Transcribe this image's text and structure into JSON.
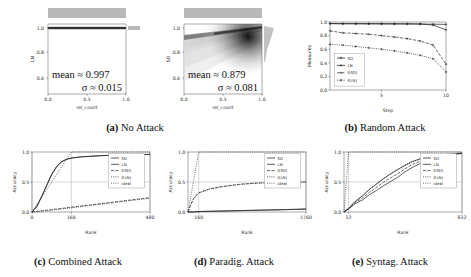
{
  "figure": {
    "caption_a": "No Attack",
    "caption_b": "Random Attack",
    "caption_c": "Combined Attack",
    "caption_d": "Paradig. Attack",
    "caption_e": "Syntag. Attack",
    "label_a": "(a)",
    "label_b": "(b)",
    "label_c": "(c)",
    "label_d": "(d)",
    "label_e": "(e)"
  },
  "chart_data": [
    {
      "id": "a-left",
      "type": "heatmap",
      "title": "No Attack — LN",
      "xlabel": "rel_count",
      "ylabel": "LN",
      "xlim": [
        0.0,
        1.0
      ],
      "ylim": [
        0.5,
        1.03
      ],
      "xticks": [
        "0.0",
        "0.5",
        "1.0"
      ],
      "yticks": [
        "0.6",
        "0.8",
        "1.0"
      ],
      "xtick_values": [
        0.0,
        0.5,
        1.0
      ],
      "ytick_values": [
        0.6,
        0.8,
        1.0
      ],
      "grid": false,
      "annotations": [
        "mean ≈ 0.997",
        "σ ≈ 0.015"
      ],
      "mean": 0.997,
      "sigma": 0.015,
      "density_note": "near-constant dark band at LN = 1.0 across all rel_count; marginal histograms flat/top-heavy",
      "marginal_top": "uniform gray band",
      "marginal_right": "single spike at 1.0"
    },
    {
      "id": "a-right",
      "type": "heatmap",
      "title": "No Attack — SD",
      "xlabel": "rel_count",
      "ylabel": "SD",
      "xlim": [
        0.0,
        1.0
      ],
      "ylim": [
        0.5,
        1.03
      ],
      "xticks": [
        "0.0",
        "0.5",
        "1.0"
      ],
      "yticks": [
        "0.6",
        "0.8",
        "1.0"
      ],
      "xtick_values": [
        0.0,
        0.5,
        1.0
      ],
      "ytick_values": [
        0.6,
        0.8,
        1.0
      ],
      "grid": false,
      "annotations": [
        "mean ≈ 0.879",
        "σ ≈ 0.081"
      ],
      "mean": 0.879,
      "sigma": 0.081,
      "density_note": "diffuse cloud rising from ~0.80 at rel_count 0 to a dark ridge near 0.97 at rel_count 1.0",
      "marginal_top": "uniform gray band",
      "marginal_right": "peak near 0.95 with tail downward"
    },
    {
      "id": "b",
      "type": "line",
      "title": "Random Attack",
      "xlabel": "Step",
      "ylabel": "Measures",
      "xlim": [
        1,
        10
      ],
      "ylim": [
        0.0,
        1.0
      ],
      "xticks": [
        "5",
        "10"
      ],
      "xtick_values": [
        5,
        10
      ],
      "yticks": [
        "0.0",
        "0.2",
        "0.4",
        "0.6",
        "0.8",
        "1.0"
      ],
      "ytick_values": [
        0.0,
        0.2,
        0.4,
        0.6,
        0.8,
        1.0
      ],
      "grid": false,
      "legend_position": "lower left",
      "x": [
        1,
        2,
        3,
        4,
        5,
        6,
        7,
        8,
        9,
        10
      ],
      "series": [
        {
          "name": "SD",
          "values": [
            0.975,
            0.973,
            0.972,
            0.972,
            0.971,
            0.97,
            0.97,
            0.969,
            0.968,
            0.965
          ]
        },
        {
          "name": "LN",
          "values": [
            0.978,
            0.977,
            0.977,
            0.976,
            0.976,
            0.975,
            0.974,
            0.972,
            0.955,
            0.885
          ]
        },
        {
          "name": "f(SD)",
          "values": [
            0.87,
            0.84,
            0.83,
            0.82,
            0.8,
            0.78,
            0.755,
            0.72,
            0.66,
            0.38
          ]
        },
        {
          "name": "f(LN)",
          "values": [
            0.67,
            0.66,
            0.64,
            0.62,
            0.6,
            0.575,
            0.545,
            0.51,
            0.46,
            0.265
          ]
        }
      ]
    },
    {
      "id": "c",
      "type": "line",
      "title": "Combined Attack",
      "xlabel": "Rank",
      "ylabel": "Accuracy",
      "xlim": [
        0,
        480
      ],
      "ylim": [
        0.0,
        1.0
      ],
      "xticks": [
        "0",
        "160",
        "480"
      ],
      "xtick_values": [
        0,
        160,
        480
      ],
      "yticks": [
        "0.0",
        "0.5",
        "1.0"
      ],
      "ytick_values": [
        0.0,
        0.5,
        1.0
      ],
      "grid": true,
      "legend_position": "right",
      "x": [
        0,
        20,
        40,
        60,
        80,
        100,
        120,
        140,
        160,
        200,
        240,
        280,
        320,
        360,
        400,
        440,
        480
      ],
      "series": [
        {
          "name": "SD",
          "values": [
            0.0,
            0.1,
            0.27,
            0.45,
            0.63,
            0.76,
            0.84,
            0.88,
            0.9,
            0.92,
            0.93,
            0.94,
            0.945,
            0.95,
            0.955,
            0.958,
            0.96
          ]
        },
        {
          "name": "LN",
          "values": [
            0.0,
            0.09,
            0.26,
            0.44,
            0.62,
            0.75,
            0.835,
            0.875,
            0.898,
            0.918,
            0.928,
            0.938,
            0.944,
            0.949,
            0.954,
            0.957,
            0.96
          ]
        },
        {
          "name": "f(SD)",
          "values": [
            0.0,
            0.01,
            0.02,
            0.03,
            0.04,
            0.05,
            0.06,
            0.07,
            0.08,
            0.1,
            0.12,
            0.14,
            0.16,
            0.18,
            0.2,
            0.22,
            0.24
          ]
        },
        {
          "name": "f(LN)",
          "values": [
            0.0,
            0.008,
            0.015,
            0.022,
            0.03,
            0.04,
            0.05,
            0.06,
            0.07,
            0.09,
            0.11,
            0.13,
            0.15,
            0.17,
            0.19,
            0.21,
            0.23
          ]
        },
        {
          "name": "ideal",
          "values": [
            0.0,
            0.125,
            0.25,
            0.375,
            0.5,
            0.625,
            0.75,
            0.875,
            1.0,
            1.0,
            1.0,
            1.0,
            1.0,
            1.0,
            1.0,
            1.0,
            1.0
          ]
        }
      ]
    },
    {
      "id": "d",
      "type": "line",
      "title": "Paradig. Attack",
      "xlabel": "Rank",
      "ylabel": "Accuracy",
      "xlim": [
        0,
        1760
      ],
      "ylim": [
        0.0,
        1.0
      ],
      "xticks": [
        "160",
        "1760"
      ],
      "xtick_values": [
        160,
        1760
      ],
      "yticks": [
        "0.0",
        "0.5",
        "1.0"
      ],
      "ytick_values": [
        0.0,
        0.5,
        1.0
      ],
      "grid": true,
      "legend_position": "upper right",
      "x": [
        0,
        40,
        80,
        120,
        160,
        320,
        480,
        640,
        800,
        960,
        1120,
        1280,
        1440,
        1600,
        1760
      ],
      "series": [
        {
          "name": "SD",
          "values": [
            0.0,
            0.0,
            0.0,
            0.005,
            0.008,
            0.012,
            0.016,
            0.02,
            0.024,
            0.028,
            0.032,
            0.036,
            0.04,
            0.045,
            0.05
          ]
        },
        {
          "name": "LN",
          "values": [
            0.0,
            0.0,
            0.0,
            0.004,
            0.007,
            0.011,
            0.015,
            0.019,
            0.023,
            0.027,
            0.031,
            0.035,
            0.039,
            0.043,
            0.048
          ]
        },
        {
          "name": "f(SD)",
          "values": [
            0.0,
            0.12,
            0.22,
            0.28,
            0.32,
            0.385,
            0.42,
            0.445,
            0.465,
            0.478,
            0.487,
            0.493,
            0.497,
            0.499,
            0.5
          ]
        },
        {
          "name": "f(LN)",
          "values": [
            0.0,
            0.11,
            0.21,
            0.27,
            0.315,
            0.38,
            0.415,
            0.44,
            0.462,
            0.475,
            0.485,
            0.491,
            0.496,
            0.498,
            0.5
          ]
        },
        {
          "name": "ideal",
          "values": [
            0.0,
            0.25,
            0.5,
            0.75,
            1.0,
            1.0,
            1.0,
            1.0,
            1.0,
            1.0,
            1.0,
            1.0,
            1.0,
            1.0,
            1.0
          ]
        }
      ]
    },
    {
      "id": "e",
      "type": "line",
      "title": "Syntag. Attack",
      "xlabel": "Rank",
      "ylabel": "Accuracy",
      "xlim": [
        0,
        832
      ],
      "ylim": [
        0.0,
        1.0
      ],
      "xticks": [
        "32",
        "832"
      ],
      "xtick_values": [
        32,
        832
      ],
      "yticks": [
        "0.0",
        "0.5",
        "1.0"
      ],
      "ytick_values": [
        0.0,
        0.5,
        1.0
      ],
      "grid": true,
      "legend_position": "upper right",
      "x": [
        0,
        32,
        80,
        130,
        180,
        230,
        280,
        330,
        380,
        430,
        480,
        530,
        580,
        640,
        700,
        760,
        832
      ],
      "series": [
        {
          "name": "SD",
          "values": [
            0.0,
            0.05,
            0.14,
            0.2,
            0.29,
            0.36,
            0.44,
            0.51,
            0.58,
            0.67,
            0.74,
            0.8,
            0.86,
            0.91,
            0.94,
            0.96,
            0.975
          ]
        },
        {
          "name": "LN",
          "values": [
            0.0,
            0.06,
            0.18,
            0.27,
            0.38,
            0.47,
            0.56,
            0.64,
            0.71,
            0.78,
            0.84,
            0.88,
            0.91,
            0.935,
            0.955,
            0.968,
            0.98
          ]
        },
        {
          "name": "f(SD)",
          "values": [
            0.0,
            0.055,
            0.16,
            0.23,
            0.33,
            0.41,
            0.5,
            0.57,
            0.64,
            0.72,
            0.79,
            0.84,
            0.885,
            0.92,
            0.945,
            0.962,
            0.977
          ]
        },
        {
          "name": "f(LN)",
          "values": [
            0.0,
            0.06,
            0.175,
            0.265,
            0.375,
            0.465,
            0.555,
            0.635,
            0.705,
            0.775,
            0.835,
            0.878,
            0.908,
            0.932,
            0.952,
            0.966,
            0.979
          ]
        },
        {
          "name": "ideal",
          "values": [
            0.0,
            1.0,
            1.0,
            1.0,
            1.0,
            1.0,
            1.0,
            1.0,
            1.0,
            1.0,
            1.0,
            1.0,
            1.0,
            1.0,
            1.0,
            1.0,
            1.0
          ]
        }
      ]
    }
  ]
}
